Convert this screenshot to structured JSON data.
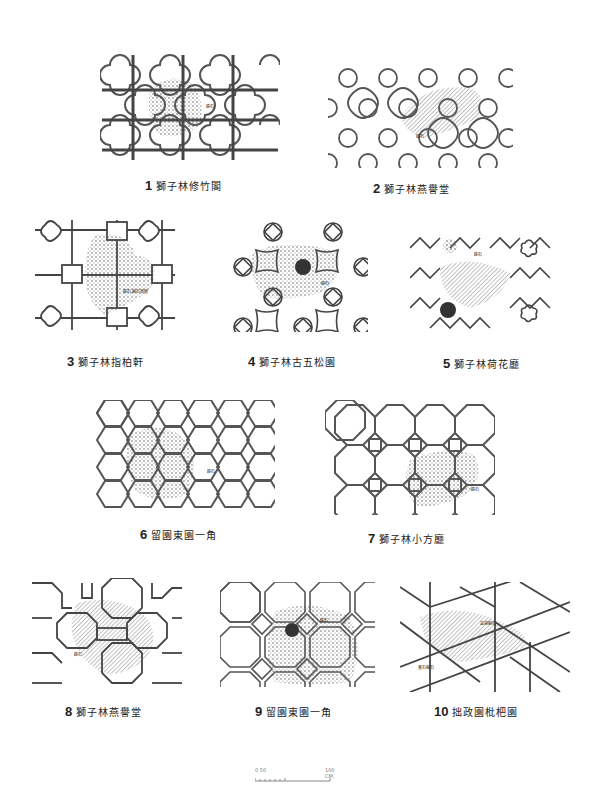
{
  "figures": [
    {
      "num": "1",
      "caption": "獅子林修竹閣"
    },
    {
      "num": "2",
      "caption": "獅子林燕譽堂"
    },
    {
      "num": "3",
      "caption": "獅子林指柏軒"
    },
    {
      "num": "4",
      "caption": "獅子林古五松園"
    },
    {
      "num": "5",
      "caption": "獅子林荷花廳"
    },
    {
      "num": "6",
      "caption": "留園東園一角"
    },
    {
      "num": "7",
      "caption": "獅子林小方廳"
    },
    {
      "num": "8",
      "caption": "獅子林燕譽堂"
    },
    {
      "num": "9",
      "caption": "留園東園一角"
    },
    {
      "num": "10",
      "caption": "拙政園枇杷園"
    }
  ],
  "annotations": {
    "fig1": "峰石",
    "fig2": "峰石",
    "fig3": "峰石,樹石草植",
    "fig4": "峰石",
    "fig5": "峰石",
    "fig6": "峰石",
    "fig7": "峰石",
    "fig8": "峰石",
    "fig9": "峰石",
    "fig10a": "盆栽樹石",
    "fig10b": "置石樹石"
  },
  "scale_bar": {
    "start_label": "0 50",
    "end_label": "100 CM."
  },
  "colors": {
    "line": "#555555",
    "shrub": "#666666",
    "background": "#ffffff"
  }
}
